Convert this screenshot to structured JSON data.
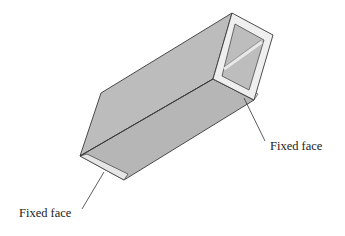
{
  "diagram": {
    "colors": {
      "face_fill": "#b8b8b8",
      "face_fill_light": "#c2c2c2",
      "section_fill": "#eeeeee",
      "inner_fill": "#bdbdbd",
      "edge": "#3a3a3a",
      "leader": "#333333"
    },
    "labels": [
      {
        "id": "fixed-face-right",
        "text": "Fixed face"
      },
      {
        "id": "fixed-face-left",
        "text": "Fixed face"
      }
    ]
  }
}
